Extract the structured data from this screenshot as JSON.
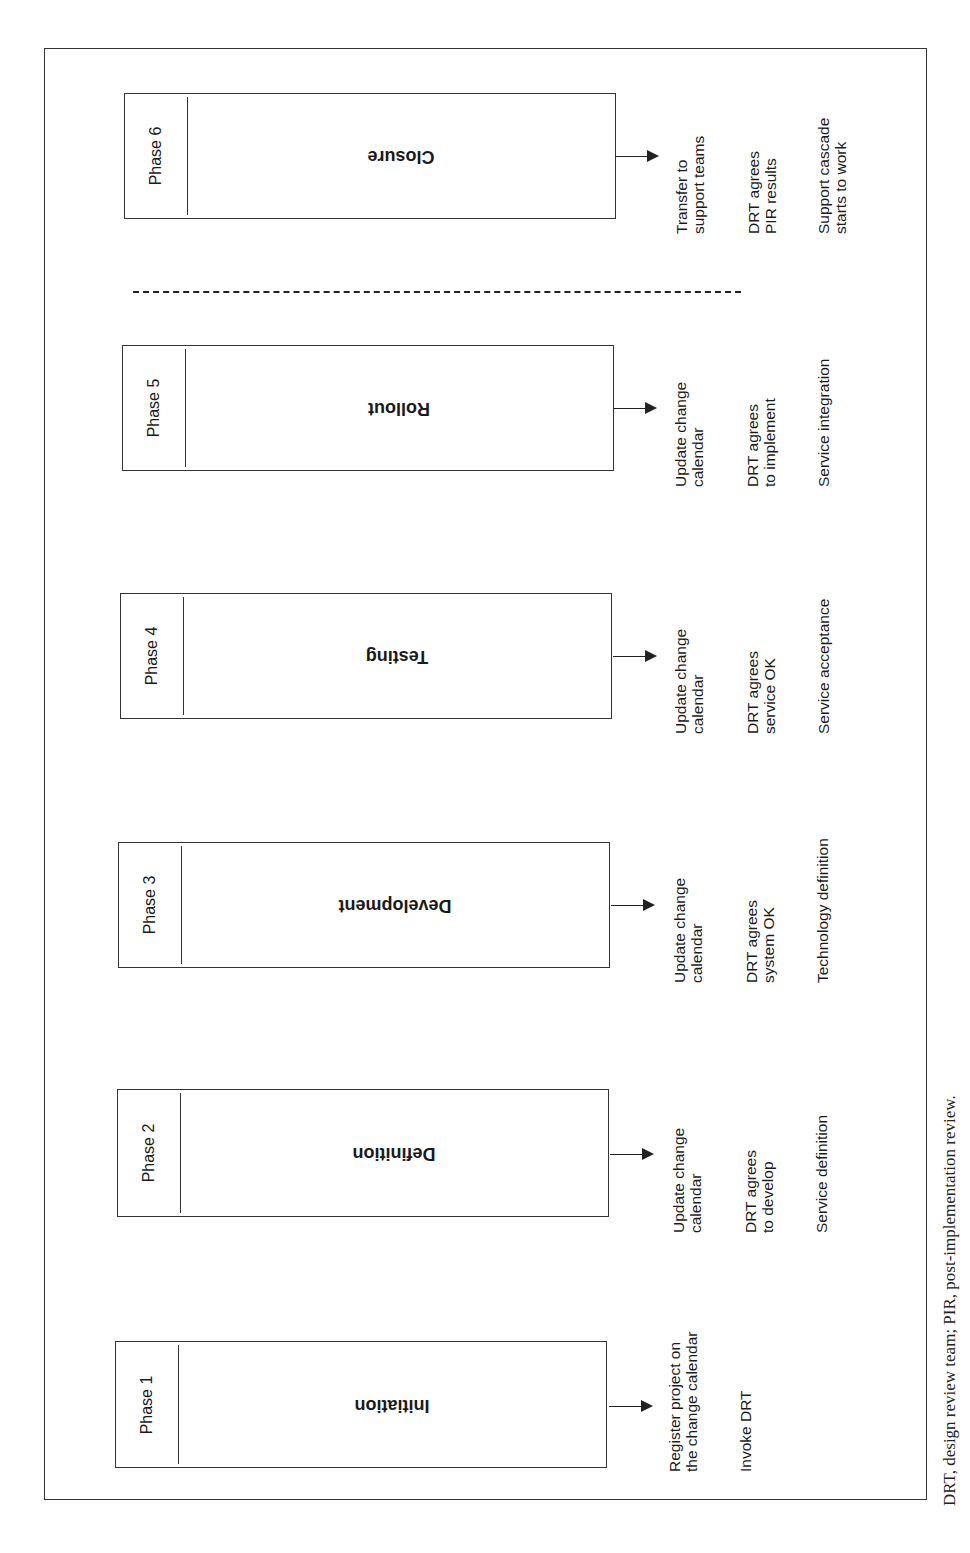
{
  "diagram": {
    "orientation": "rotated landscape figure (page rotated 90 degrees)",
    "phases": [
      {
        "label": "Phase 6",
        "title": "Closure",
        "notes": [
          [
            "Transfer to",
            "support teams"
          ],
          [
            "DRT agrees",
            "PIR results"
          ],
          [
            "Support cascade",
            "starts to work"
          ]
        ]
      },
      {
        "label": "Phase 5",
        "title": "Rollout",
        "notes": [
          [
            "Update change",
            "calendar"
          ],
          [
            "DRT agrees",
            "to implement"
          ],
          [
            "Service integration"
          ]
        ]
      },
      {
        "label": "Phase 4",
        "title": "Testing",
        "notes": [
          [
            "Update change",
            "calendar"
          ],
          [
            "DRT agrees",
            "service OK"
          ],
          [
            "Service acceptance"
          ]
        ]
      },
      {
        "label": "Phase 3",
        "title": "Development",
        "notes": [
          [
            "Update change",
            "calendar"
          ],
          [
            "DRT agrees",
            "system OK"
          ],
          [
            "Technology definition"
          ]
        ]
      },
      {
        "label": "Phase 2",
        "title": "Definition",
        "notes": [
          [
            "Update change",
            "calendar"
          ],
          [
            "DRT agrees",
            "to develop"
          ],
          [
            "Service definition"
          ]
        ]
      },
      {
        "label": "Phase 1",
        "title": "Initiation",
        "notes": [
          [
            "Register project on",
            "the change calendar"
          ],
          [
            "Invoke DRT"
          ]
        ]
      }
    ],
    "separator": "dashed line between Phase 5 and Phase 6",
    "caption": "DRT, design review team; PIR, post-implementation review."
  }
}
